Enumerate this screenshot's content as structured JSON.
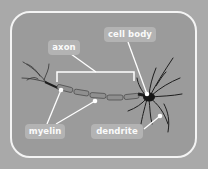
{
  "diagram": {
    "labels": {
      "axon": "axon",
      "cell_body": "cell body",
      "myelin": "myelin",
      "dendrite": "dendrite"
    },
    "colors": {
      "background": "#a9a9a9",
      "panel": "#9b9b9b",
      "panel_border": "#f4f4f4",
      "label_pill": "#b3b3b3",
      "label_text": "#fafafa",
      "neuron": "#1e1e1e",
      "myelin": "#8a8a8a",
      "leader_line": "#ffffff"
    }
  }
}
